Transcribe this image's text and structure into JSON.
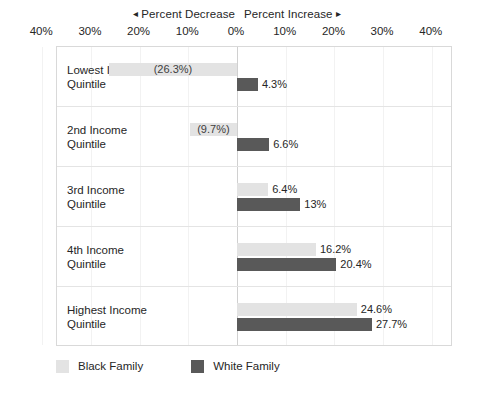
{
  "chart_data": {
    "type": "bar",
    "title": "",
    "subtitle": "",
    "xlabel": "",
    "ylabel": "",
    "orientation": "horizontal-diverging",
    "grid": true,
    "legend_position": "bottom-left",
    "axis": {
      "tick_labels": [
        "40%",
        "30%",
        "20%",
        "10%",
        "0%",
        "10%",
        "20%",
        "30%",
        "40%"
      ],
      "tick_values": [
        -40,
        -30,
        -20,
        -10,
        0,
        10,
        20,
        30,
        40
      ],
      "xlim": [
        -40,
        40
      ],
      "left_direction_label": "Percent Decrease",
      "right_direction_label": "Percent Increase",
      "left_arrow": "◂",
      "right_arrow": "▸"
    },
    "categories": [
      "Lowest Income\nQuintile",
      "2nd Income\nQuintile",
      "3rd Income\nQuintile",
      "4th Income\nQuintile",
      "Highest Income\nQuintile"
    ],
    "series": [
      {
        "name": "Black Family",
        "color": "#e3e3e3",
        "values": [
          -26.3,
          -9.7,
          6.4,
          16.2,
          24.6
        ],
        "labels": [
          "(26.3%)",
          "(9.7%)",
          "6.4%",
          "16.2%",
          "24.6%"
        ]
      },
      {
        "name": "White Family",
        "color": "#595959",
        "values": [
          4.3,
          6.6,
          13.0,
          20.4,
          27.7
        ],
        "labels": [
          "4.3%",
          "6.6%",
          "13%",
          "20.4%",
          "27.7%"
        ]
      }
    ]
  },
  "legend": {
    "items": [
      {
        "label": "Black Family",
        "swatch": "light"
      },
      {
        "label": "White Family",
        "swatch": "dark"
      }
    ]
  },
  "colors": {
    "black_family_bar": "#e3e3e3",
    "white_family_bar": "#595959",
    "frame_border": "#d9d9d9",
    "row_divider": "#e4e4e4",
    "zero_line": "#d0d0d0",
    "text": "#262626"
  }
}
